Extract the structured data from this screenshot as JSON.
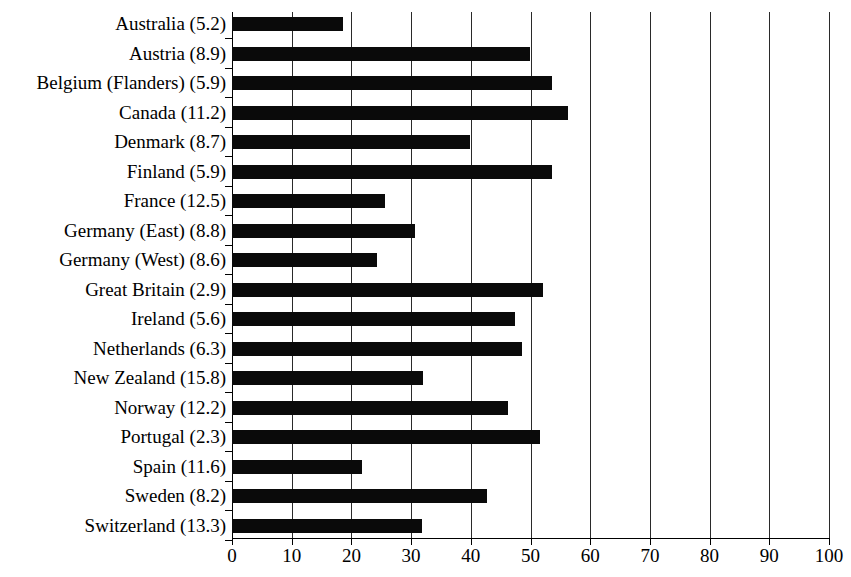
{
  "chart_data": {
    "type": "bar",
    "orientation": "horizontal",
    "title": "",
    "xlabel": "",
    "ylabel": "",
    "xlim": [
      0,
      100
    ],
    "xticks": [
      0,
      10,
      20,
      30,
      40,
      50,
      60,
      70,
      80,
      90,
      100
    ],
    "xtick_labels": [
      "0",
      "10",
      "20",
      "30",
      "40",
      "50",
      "60",
      "70",
      "80",
      "90",
      "100"
    ],
    "grid": "vertical",
    "legend": "none",
    "bar_color": "#0a0a0a",
    "categories": [
      "Australia (5.2)",
      "Austria (8.9)",
      "Belgium (Flanders) (5.9)",
      "Canada (11.2)",
      "Denmark (8.7)",
      "Finland (5.9)",
      "France (12.5)",
      "Germany (East) (8.8)",
      "Germany (West) (8.6)",
      "Great Britain (2.9)",
      "Ireland (5.6)",
      "Netherlands (6.3)",
      "New Zealand (15.8)",
      "Norway (12.2)",
      "Portugal (2.3)",
      "Spain (11.6)",
      "Sweden (8.2)",
      "Switzerland (13.3)"
    ],
    "values": [
      18.6,
      49.9,
      53.6,
      56.3,
      39.9,
      53.6,
      25.6,
      30.7,
      24.3,
      52.1,
      47.4,
      48.6,
      32.0,
      46.2,
      51.6,
      21.8,
      42.7,
      31.8
    ]
  }
}
